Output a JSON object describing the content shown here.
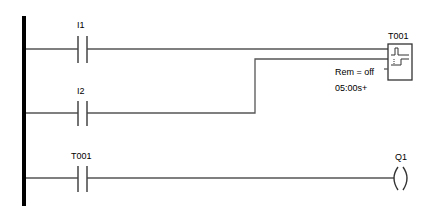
{
  "diagram": {
    "type": "ladder-logic",
    "rails": {
      "left_rail_color": "#000000",
      "wire_color": "#505050"
    },
    "rungs": [
      {
        "id": "rung-1",
        "contact": {
          "label": "I1",
          "type": "normally-open"
        },
        "target": "T001-trigger"
      },
      {
        "id": "rung-2",
        "contact": {
          "label": "I2",
          "type": "normally-open"
        },
        "target": "T001-reset"
      },
      {
        "id": "rung-3",
        "contact": {
          "label": "T001",
          "type": "normally-open"
        },
        "coil": {
          "label": "Q1",
          "type": "output-coil"
        }
      }
    ],
    "timer": {
      "label": "T001",
      "retentive": "Rem = off",
      "time_setting": "05:00s+",
      "icons": [
        "pulse-icon",
        "step-icon"
      ]
    }
  }
}
